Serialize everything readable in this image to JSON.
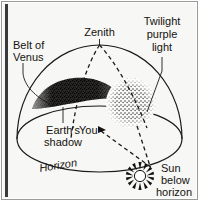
{
  "figure": {
    "background_color": "#f7f7f5",
    "ink_color": "#15130f"
  },
  "labels": {
    "belt_of_venus": {
      "line1": "Belt of",
      "line2": "Venus"
    },
    "zenith": "Zenith",
    "twilight_purple_light": {
      "line1": "Twilight",
      "line2": "purple",
      "line3": "light"
    },
    "earths_shadow": {
      "line1": "Earth's",
      "line2": "shadow"
    },
    "you": "You",
    "horizon": "Horizon",
    "sun_below_horizon": {
      "line1": "Sun",
      "line2": "below",
      "line3": "horizon"
    }
  },
  "elements": {
    "sky_dome": "sky-dome",
    "horizon_ellipse": "horizon-plane-ellipse",
    "earth_shadow_region": "earth-shadow-dark-stipple",
    "purple_light_region": "twilight-purple-light-stipple",
    "meridian_arc_left": "dashed-meridian-arc-left",
    "meridian_arc_right": "dashed-meridian-arc-right",
    "sight_line": "dashed-sight-line-you-to-sun",
    "drop_line": "dashed-vertical-drop-line",
    "sun_glyph": "sun-starburst-icon",
    "observer_marker": "observer-position-marker"
  }
}
